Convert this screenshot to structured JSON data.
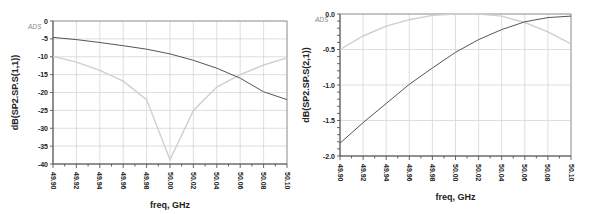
{
  "chart_data": [
    {
      "type": "line",
      "title": "",
      "xlabel": "freq, GHz",
      "ylabel": "dB(SP2.SP.S(1,1))",
      "corner_label": "ADS",
      "xlim": [
        49.9,
        50.1
      ],
      "ylim": [
        -40,
        0
      ],
      "x_ticks": [
        "49.90",
        "49.92",
        "49.94",
        "49.96",
        "49.98",
        "50.00",
        "50.02",
        "50.04",
        "50.06",
        "50.08",
        "50.10"
      ],
      "y_ticks": [
        "0",
        "-5",
        "-10",
        "-15",
        "-20",
        "-25",
        "-30",
        "-35",
        "-40"
      ],
      "grid": true,
      "legend": "none",
      "x": [
        49.9,
        49.92,
        49.94,
        49.96,
        49.98,
        50.0,
        50.02,
        50.04,
        50.06,
        50.08,
        50.1
      ],
      "series": [
        {
          "name": "S(1,1) dark",
          "color": "#555555",
          "values": [
            -4.6,
            -5.2,
            -6.0,
            -6.9,
            -7.9,
            -9.2,
            -11.0,
            -13.2,
            -16.0,
            -19.8,
            -22.0
          ]
        },
        {
          "name": "S(1,1) light",
          "color": "#cfcfcf",
          "values": [
            -9.9,
            -11.5,
            -13.8,
            -16.8,
            -22.0,
            -38.8,
            -25.0,
            -18.5,
            -15.0,
            -12.3,
            -10.3
          ]
        }
      ]
    },
    {
      "type": "line",
      "title": "",
      "xlabel": "freq, GHz",
      "ylabel": "dB(SP2.SP.S(2,1))",
      "corner_label": "ADS",
      "xlim": [
        49.9,
        50.1
      ],
      "ylim": [
        -2.0,
        0.0
      ],
      "x_ticks": [
        "49.90",
        "49.92",
        "49.94",
        "49.96",
        "49.98",
        "50.00",
        "50.02",
        "50.04",
        "50.06",
        "50.08",
        "50.10"
      ],
      "y_ticks": [
        "0.0",
        "-0.5",
        "-1.0",
        "-1.5",
        "-2.0"
      ],
      "grid": true,
      "legend": "none",
      "x": [
        49.9,
        49.92,
        49.94,
        49.96,
        49.98,
        50.0,
        50.02,
        50.04,
        50.06,
        50.08,
        50.1
      ],
      "series": [
        {
          "name": "S(2,1) dark",
          "color": "#555555",
          "values": [
            -1.82,
            -1.53,
            -1.26,
            -0.99,
            -0.76,
            -0.54,
            -0.36,
            -0.22,
            -0.11,
            -0.05,
            -0.03
          ]
        },
        {
          "name": "S(2,1) light",
          "color": "#cfcfcf",
          "values": [
            -0.5,
            -0.31,
            -0.17,
            -0.08,
            -0.02,
            0.0,
            0.0,
            -0.03,
            -0.12,
            -0.25,
            -0.42
          ]
        }
      ]
    }
  ]
}
